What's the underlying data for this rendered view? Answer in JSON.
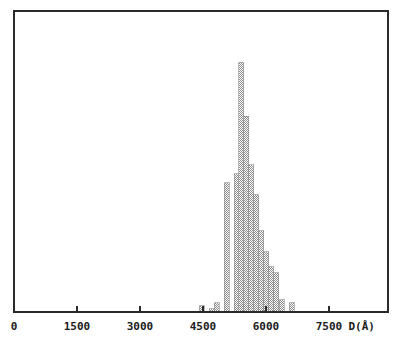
{
  "chart_data": {
    "type": "bar",
    "title": "",
    "subtitle": "",
    "xlabel": "D(Å)",
    "ylabel": "",
    "xlim": [
      0,
      8800
    ],
    "ylim": [
      0,
      100
    ],
    "grid": false,
    "legend": null,
    "xticks": [
      0,
      1500,
      3000,
      4500,
      6000,
      7500
    ],
    "xtick_labels": [
      "0",
      "1500",
      "3000",
      "4500",
      "6000",
      "7500"
    ],
    "yticks": [],
    "ytick_labels": [],
    "bar_fill_color": "#a8a8a8",
    "bar_edge_color": "#8c8c8c",
    "axis_color": "#2a2a2a",
    "background_color": "#ffffff",
    "bin_width": 119,
    "categories": [
      "4405",
      "4524",
      "4643",
      "4762",
      "4881",
      "5000",
      "5119",
      "5238",
      "5357",
      "5476",
      "5595",
      "5714",
      "5833",
      "5952",
      "6071",
      "6190",
      "6310",
      "6429",
      "6548",
      "6667",
      "6786"
    ],
    "values": [
      2,
      0,
      1,
      3,
      0,
      43,
      0,
      46,
      83,
      65,
      49,
      39,
      27,
      20,
      15,
      13,
      4,
      0,
      3,
      0,
      0
    ],
    "annotations": []
  },
  "axes": {
    "x_axis_label": "D(Å)",
    "x_tick_0": "0",
    "x_tick_1": "1500",
    "x_tick_2": "3000",
    "x_tick_3": "4500",
    "x_tick_4": "6000",
    "x_tick_5": "7500"
  },
  "figure": {
    "caption": ""
  }
}
